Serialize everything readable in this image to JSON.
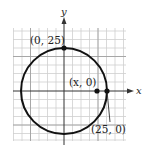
{
  "diagram": {
    "type": "circle-on-coordinate-grid",
    "axes": {
      "x_label": "x",
      "y_label": "y"
    },
    "points": [
      {
        "label": "(0, 25)",
        "x": 0,
        "y": 25
      },
      {
        "label": "(x, 0)",
        "x": "x",
        "y": 0
      },
      {
        "label": "(25, 0)",
        "x": 25,
        "y": 0
      }
    ],
    "circle": {
      "center": [
        0,
        0
      ],
      "radius": 25
    },
    "colors": {
      "grid": "#c8c8c8",
      "axis": "#333333",
      "circle": "#111111",
      "point": "#111111"
    }
  }
}
